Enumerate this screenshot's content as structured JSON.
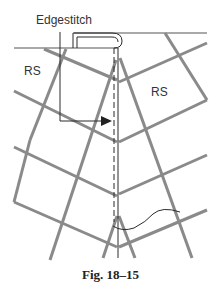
{
  "labels": {
    "edgestitch": "Edgestitch",
    "rs_left": "RS",
    "rs_right": "RS",
    "caption": "Fig. 18–15"
  },
  "colors": {
    "plaid": "#8a8a8a",
    "ink": "#2a2a2a",
    "background": "#ffffff"
  }
}
